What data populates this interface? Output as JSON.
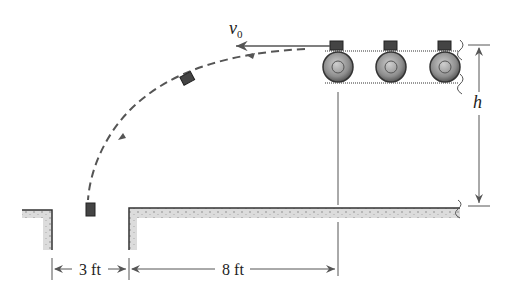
{
  "figure": {
    "type": "projectile-conveyor-diagram",
    "labels": {
      "velocity": "v",
      "velocity_subscript": "0",
      "height": "h",
      "gap_dimension": "3 ft",
      "distance_dimension": "8 ft"
    },
    "elements": {
      "conveyor_rollers": 3,
      "boxes_on_belt": 3,
      "boxes_in_flight": 2
    },
    "colors": {
      "line": "#555555",
      "box": "#444444",
      "ground_fill": "#d9d9d9",
      "roller_fill": "#9a9a9a"
    }
  }
}
